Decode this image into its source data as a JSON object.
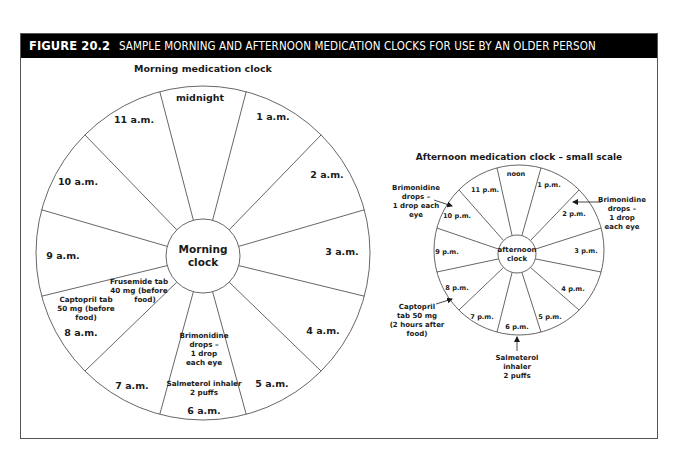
{
  "figure": {
    "number": "FIGURE 20.2",
    "title": "SAMPLE MORNING AND AFTERNOON MEDICATION CLOCKS FOR USE BY AN OLDER PERSON"
  },
  "colors": {
    "header_bg": "#000000",
    "header_text": "#ffffff",
    "line": "#555555",
    "text": "#1a1a1a"
  },
  "morning_clock": {
    "title": "Morning medication clock",
    "center_line1": "Morning",
    "center_line2": "clock",
    "segments": [
      "midnight",
      "1 a.m.",
      "2 a.m.",
      "3 a.m.",
      "4 a.m.",
      "5 a.m.",
      "6 a.m.",
      "7 a.m.",
      "8 a.m.",
      "9 a.m.",
      "10 a.m.",
      "11 a.m."
    ],
    "notes": {
      "frusemide": [
        "Frusemide tab",
        "40 mg (before",
        "food)"
      ],
      "captopril": [
        "Captopril tab",
        "50 mg (before",
        "food)"
      ],
      "brimonidine": [
        "Brimonidine",
        "drops –",
        "1 drop",
        "each eye"
      ],
      "salmeterol": [
        "Salmeterol inhaler",
        "2 puffs"
      ]
    }
  },
  "afternoon_clock": {
    "title": "Afternoon medication clock – small scale",
    "center_line1": "afternoon",
    "center_line2": "clock",
    "segments": [
      "noon",
      "1 p.m.",
      "2 p.m.",
      "3 p.m.",
      "4 p.m.",
      "5 p.m.",
      "6 p.m.",
      "7 p.m.",
      "8 p.m.",
      "9 p.m.",
      "10 p.m.",
      "11 p.m."
    ],
    "callouts": {
      "brimonidine_left": [
        "Brimonidine",
        "drops –",
        "1 drop each",
        "eye"
      ],
      "brimonidine_right": [
        "Brimonidine",
        "drops –",
        "1 drop",
        "each eye"
      ],
      "captopril": [
        "Captopril",
        "tab 50 mg",
        "(2 hours after",
        "food)"
      ],
      "salmeterol": [
        "Salmeterol",
        "inhaler",
        "2 puffs"
      ]
    }
  }
}
